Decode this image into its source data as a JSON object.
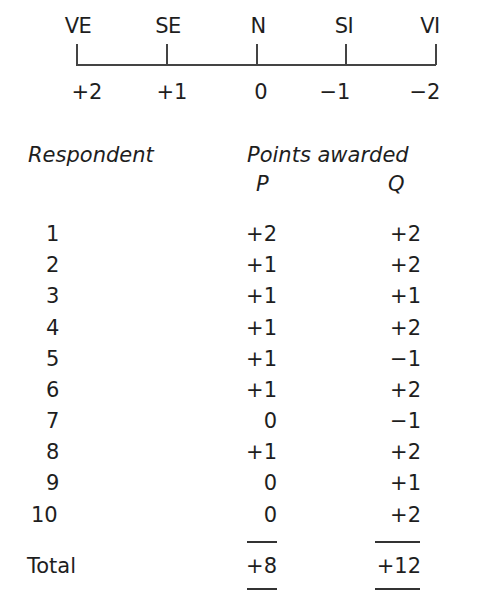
{
  "scale": {
    "labels": [
      "VE",
      "SE",
      "N",
      "SI",
      "VI"
    ],
    "values": [
      "+2",
      "+1",
      "0",
      "−1",
      "−2"
    ]
  },
  "table": {
    "header_respondent": "Respondent",
    "header_points": "Points awarded",
    "col_p": "P",
    "col_q": "Q",
    "rows": [
      {
        "respondent": "1",
        "p": "+2",
        "q": "+2"
      },
      {
        "respondent": "2",
        "p": "+1",
        "q": "+2"
      },
      {
        "respondent": "3",
        "p": "+1",
        "q": "+1"
      },
      {
        "respondent": "4",
        "p": "+1",
        "q": "+2"
      },
      {
        "respondent": "5",
        "p": "+1",
        "q": "−1"
      },
      {
        "respondent": "6",
        "p": "+1",
        "q": "+2"
      },
      {
        "respondent": "7",
        "p": "0",
        "q": "−1"
      },
      {
        "respondent": "8",
        "p": "+1",
        "q": "+2"
      },
      {
        "respondent": "9",
        "p": "0",
        "q": "+1"
      },
      {
        "respondent": "10",
        "p": "0",
        "q": "+2"
      }
    ],
    "total_label": "Total",
    "total_p": "+8",
    "total_q": "+12"
  }
}
